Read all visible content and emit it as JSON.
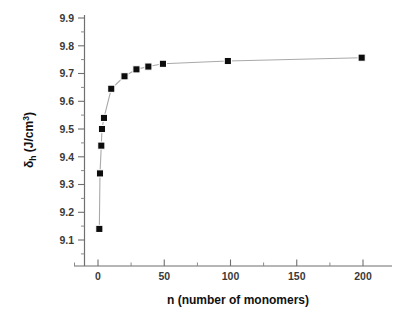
{
  "chart_data": {
    "type": "scatter",
    "title": "",
    "xlabel": "n (number of monomers)",
    "ylabel": "δh (J/cm3)",
    "ylabel_parts": {
      "symbol": "δ",
      "subscript": "h",
      "units_prefix": " (J/cm",
      "units_superscript": "3",
      "units_suffix": ")"
    },
    "xlim": [
      -20,
      220
    ],
    "ylim": [
      9.05,
      9.93
    ],
    "xticks": [
      0,
      50,
      100,
      150,
      200
    ],
    "xtick_labels": [
      "0",
      "50",
      "100",
      "150",
      "200"
    ],
    "yticks": [
      9.1,
      9.2,
      9.3,
      9.4,
      9.5,
      9.6,
      9.7,
      9.8,
      9.9
    ],
    "ytick_labels": [
      "9.1",
      "9.2",
      "9.3",
      "9.4",
      "9.5",
      "9.6",
      "9.7",
      "9.8",
      "9.9"
    ],
    "grid": false,
    "legend": null,
    "marker": "filled-square",
    "marker_color": "#0d0d0d",
    "line_color": "#a9a9a9",
    "axis_color": "#6f6f6f",
    "background_color": "#ffffff",
    "series": [
      {
        "name": "delta_h vs n",
        "x": [
          1,
          1.5,
          2.5,
          3,
          4.5,
          10,
          20,
          29,
          38,
          49,
          98,
          199
        ],
        "y": [
          9.14,
          9.34,
          9.44,
          9.5,
          9.54,
          9.645,
          9.69,
          9.715,
          9.725,
          9.735,
          9.745,
          9.757
        ]
      }
    ]
  },
  "axes": {
    "x_axis_name": "x-axis",
    "y_axis_name": "y-axis"
  }
}
